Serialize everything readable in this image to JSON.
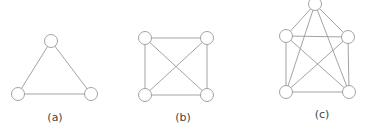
{
  "graphs": [
    {
      "label": "(a)",
      "label_pos": [
        55,
        111
      ],
      "nodes": [
        [
          51,
          41
        ],
        [
          18,
          94
        ],
        [
          91,
          94
        ]
      ],
      "edges": [
        [
          0,
          1
        ],
        [
          0,
          2
        ],
        [
          1,
          2
        ]
      ]
    },
    {
      "label": "(b)",
      "label_pos": [
        183,
        111
      ],
      "nodes": [
        [
          145,
          38
        ],
        [
          207,
          38
        ],
        [
          145,
          95
        ],
        [
          207,
          95
        ]
      ],
      "edges": [
        [
          0,
          1
        ],
        [
          0,
          2
        ],
        [
          0,
          3
        ],
        [
          1,
          2
        ],
        [
          1,
          3
        ],
        [
          2,
          3
        ]
      ]
    },
    {
      "label": "(c)",
      "label_pos": [
        322,
        108
      ],
      "nodes": [
        [
          315,
          4
        ],
        [
          286,
          36
        ],
        [
          348,
          37
        ],
        [
          286,
          92
        ],
        [
          349,
          92
        ]
      ],
      "edges": [
        [
          0,
          1
        ],
        [
          0,
          2
        ],
        [
          0,
          3
        ],
        [
          0,
          4
        ],
        [
          1,
          2
        ],
        [
          1,
          3
        ],
        [
          1,
          4
        ],
        [
          2,
          3
        ],
        [
          2,
          4
        ],
        [
          3,
          4
        ]
      ]
    }
  ],
  "style": {
    "stroke": "#999999",
    "node_radius": 6.5
  }
}
